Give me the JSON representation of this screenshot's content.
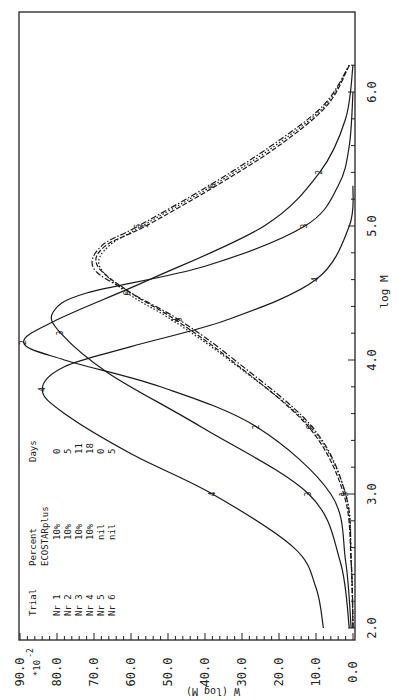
{
  "chart_data": {
    "type": "line",
    "orientation": "rotated 90 degrees (x-axis log M runs vertically, W axis runs horizontally)",
    "title": "",
    "xlabel": "log M",
    "ylabel": "W (log M)",
    "ylabel_multiplier": "*10^-2",
    "xlim": [
      2.0,
      6.3
    ],
    "ylim": [
      0.0,
      90.0
    ],
    "x_ticks": [
      "2.0",
      "3.0",
      "4.0",
      "5.0",
      "6.0"
    ],
    "y_ticks": [
      "0.0",
      "10.0",
      "20.0",
      "30.0",
      "40.0",
      "50.0",
      "60.0",
      "70.0",
      "80.0",
      "90.0"
    ],
    "grid": false,
    "legend": {
      "position": "upper-left (bottom-left in rotated image)",
      "headers": [
        "Trial",
        "Percent ECOSTARplus",
        "Days"
      ],
      "rows": [
        {
          "trial": "Nr 1",
          "percent": "10%",
          "days": "0"
        },
        {
          "trial": "Nr 2",
          "percent": "10%",
          "days": "5"
        },
        {
          "trial": "Nr 3",
          "percent": "10%",
          "days": "11"
        },
        {
          "trial": "Nr 4",
          "percent": "10%",
          "days": "18"
        },
        {
          "trial": "Nr 5",
          "percent": "nil",
          "days": "0"
        },
        {
          "trial": "Nr 6",
          "percent": "nil",
          "days": "5"
        }
      ]
    },
    "series": [
      {
        "name": "Nr 1",
        "marker": "1",
        "style": "dashed",
        "x": [
          2.0,
          2.5,
          3.0,
          3.5,
          4.0,
          4.3,
          4.5,
          4.7,
          4.85,
          5.0,
          5.3,
          5.6,
          5.9,
          6.2
        ],
        "y": [
          0.0,
          0.5,
          2.5,
          12.0,
          33.0,
          48.0,
          60.0,
          69.0,
          67.0,
          56.0,
          37.0,
          20.0,
          7.0,
          1.0
        ]
      },
      {
        "name": "Nr 2",
        "marker": "2",
        "style": "solid",
        "x": [
          2.0,
          2.5,
          3.0,
          3.5,
          3.8,
          4.0,
          4.13,
          4.3,
          4.6,
          5.0,
          5.4,
          5.8,
          6.2
        ],
        "y": [
          0.5,
          2.0,
          6.0,
          26.0,
          52.0,
          78.0,
          89.0,
          80.0,
          55.0,
          24.0,
          9.0,
          2.0,
          0.0
        ]
      },
      {
        "name": "Nr 3",
        "marker": "3",
        "style": "solid",
        "x": [
          2.0,
          2.5,
          3.0,
          3.5,
          3.9,
          4.2,
          4.36,
          4.5,
          4.7,
          5.0,
          5.3,
          5.6,
          6.0
        ],
        "y": [
          1.0,
          3.5,
          12.0,
          41.0,
          66.0,
          79.0,
          81.0,
          72.0,
          40.0,
          13.0,
          4.0,
          1.0,
          0.0
        ]
      },
      {
        "name": "Nr 4",
        "marker": "4",
        "style": "solid",
        "x": [
          2.0,
          2.3,
          2.6,
          3.0,
          3.3,
          3.6,
          3.78,
          3.95,
          4.1,
          4.3,
          4.6,
          5.0,
          5.3
        ],
        "y": [
          8.0,
          10.0,
          16.0,
          38.0,
          60.0,
          78.0,
          84.0,
          78.0,
          60.0,
          34.0,
          10.0,
          1.0,
          0.0
        ]
      },
      {
        "name": "Nr 5",
        "marker": "5",
        "style": "dash-dot",
        "x": [
          2.0,
          2.5,
          3.0,
          3.5,
          4.0,
          4.3,
          4.5,
          4.68,
          4.85,
          5.0,
          5.3,
          5.6,
          5.9,
          6.2
        ],
        "y": [
          0.0,
          0.5,
          2.0,
          11.0,
          32.0,
          47.0,
          60.0,
          70.0,
          68.0,
          58.0,
          39.0,
          22.0,
          8.0,
          1.0
        ]
      },
      {
        "name": "Nr 6",
        "marker": "6",
        "style": "dotted",
        "x": [
          2.0,
          2.5,
          3.0,
          3.5,
          4.0,
          4.3,
          4.5,
          4.7,
          4.85,
          5.0,
          5.3,
          5.6,
          5.9,
          6.2
        ],
        "y": [
          0.0,
          0.5,
          2.0,
          11.5,
          33.5,
          49.0,
          61.0,
          68.5,
          66.0,
          57.0,
          38.0,
          21.0,
          7.5,
          1.0
        ]
      }
    ]
  },
  "axes": {
    "x_label": "log M",
    "y_label": "W (log M)",
    "y_multiplier_base": "*10",
    "y_multiplier_exp": "-2"
  },
  "legend": {
    "h_trial": "Trial",
    "h_percent": "Percent",
    "h_percent2": "ECOSTARplus",
    "h_days": "Days"
  }
}
